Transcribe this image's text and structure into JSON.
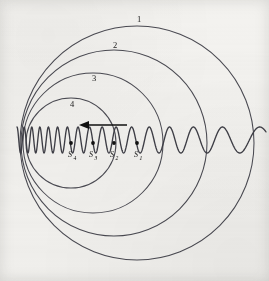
{
  "figure": {
    "canvas": {
      "width": 269,
      "height": 281
    },
    "background_color": "#f3f2ef",
    "line_color": "#4a4a52",
    "ink_color": "#111111"
  },
  "chart_data": {
    "type": "scatter",
    "xlabel": "",
    "ylabel": "",
    "xlim": [
      0,
      269
    ],
    "ylim": [
      0,
      281
    ],
    "grid": false,
    "legend": null,
    "wavefronts": [
      {
        "label": "1",
        "center_x": 137,
        "center_y": 143,
        "radius": 117,
        "label_x": 139,
        "label_y": 22
      },
      {
        "label": "2",
        "center_x": 114,
        "center_y": 143,
        "radius": 93,
        "label_x": 115,
        "label_y": 48
      },
      {
        "label": "3",
        "center_x": 93,
        "center_y": 143,
        "radius": 70,
        "label_x": 94,
        "label_y": 81
      },
      {
        "label": "4",
        "center_x": 71,
        "center_y": 143,
        "radius": 45,
        "label_x": 72,
        "label_y": 107
      }
    ],
    "sources": [
      {
        "label": "S",
        "subscript": "4",
        "x": 71,
        "y": 143,
        "label_x": 68,
        "label_y": 157
      },
      {
        "label": "S",
        "subscript": "3",
        "x": 93,
        "y": 143,
        "label_x": 89,
        "label_y": 157
      },
      {
        "label": "S",
        "subscript": "2",
        "x": 114,
        "y": 143,
        "label_x": 110,
        "label_y": 157
      },
      {
        "label": "S",
        "subscript": "1",
        "x": 137,
        "y": 143,
        "label_x": 134,
        "label_y": 157
      }
    ],
    "motion_arrow": {
      "name": "velocity-arrow",
      "direction": "left",
      "tail_x": 127,
      "tip_x": 79,
      "y": 125
    },
    "wave_trace": {
      "baseline_y": 140,
      "x_start": 17,
      "x_end": 266,
      "amplitude": 13,
      "description": "Transverse wave trace: compressed (short wavelength) on the left ahead of the moving source, stretched (long wavelength) on the right behind it",
      "left_wavelength": 7,
      "right_wavelength": 45
    }
  },
  "labels": {
    "ring_1": "1",
    "ring_2": "2",
    "ring_3": "3",
    "ring_4": "4",
    "source_1_base": "S",
    "source_1_sub": "1",
    "source_2_base": "S",
    "source_2_sub": "2",
    "source_3_base": "S",
    "source_3_sub": "3",
    "source_4_base": "S",
    "source_4_sub": "4"
  }
}
